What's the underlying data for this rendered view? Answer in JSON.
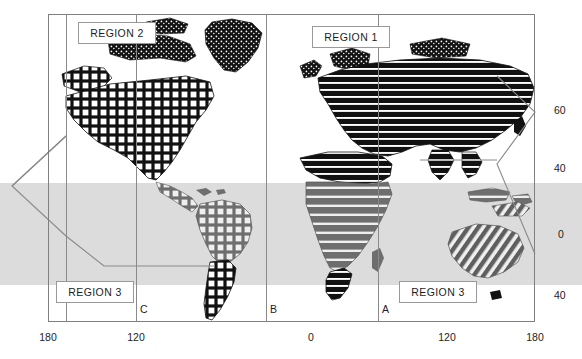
{
  "figure": {
    "type": "world-map-region-diagram",
    "caption": ""
  },
  "axes": {
    "x": {
      "label": "",
      "ticks": [
        {
          "value": "180",
          "x": 48
        },
        {
          "value": "120",
          "x": 136
        },
        {
          "value": "0",
          "x": 311
        },
        {
          "value": "120",
          "x": 447
        },
        {
          "value": "180",
          "x": 535
        }
      ],
      "range": [
        -180,
        180
      ]
    },
    "y": {
      "label": "",
      "ticks": [
        {
          "value": "60",
          "y": 110
        },
        {
          "value": "40",
          "y": 168
        },
        {
          "value": "0",
          "y": 234
        },
        {
          "value": "40",
          "y": 295
        }
      ],
      "range": [
        -60,
        80
      ]
    }
  },
  "dividers": [
    {
      "name": "divider-c",
      "x": 136
    },
    {
      "name": "divider-b",
      "x": 266
    },
    {
      "name": "divider-a",
      "x": 378
    },
    {
      "name": "divider-inner-left",
      "x": 66
    }
  ],
  "markers": [
    {
      "label": "C",
      "x": 140,
      "y": 305
    },
    {
      "label": "B",
      "x": 270,
      "y": 305
    },
    {
      "label": "A",
      "x": 382,
      "y": 305
    }
  ],
  "regions": [
    {
      "label": "REGION 2",
      "x": 78,
      "y": 22,
      "w": 78,
      "h": 22
    },
    {
      "label": "REGION 1",
      "x": 312,
      "y": 26,
      "w": 78,
      "h": 22
    },
    {
      "label": "REGION 3",
      "x": 56,
      "y": 281,
      "w": 78,
      "h": 22
    },
    {
      "label": "REGION 3",
      "x": 399,
      "y": 281,
      "w": 78,
      "h": 22
    }
  ],
  "bands": [
    {
      "name": "tropical-band",
      "top": 183,
      "height": 102,
      "color": "#dcdcdc"
    }
  ],
  "colors": {
    "frame": "#808080",
    "band": "#dcdcdc",
    "land_dark": "#111111",
    "land_mid": "#6e6e6e",
    "text": "#1d1d1d",
    "background": "#ffffff"
  },
  "landmasses": [
    {
      "name": "north-america",
      "pattern": "grid"
    },
    {
      "name": "south-america",
      "pattern": "grid"
    },
    {
      "name": "greenland",
      "pattern": "speckle"
    },
    {
      "name": "eurasia",
      "pattern": "horizontal-stripes"
    },
    {
      "name": "africa",
      "pattern": "horizontal-stripes"
    },
    {
      "name": "australia",
      "pattern": "diagonal-hatch"
    },
    {
      "name": "antarctica",
      "pattern": "none"
    }
  ]
}
